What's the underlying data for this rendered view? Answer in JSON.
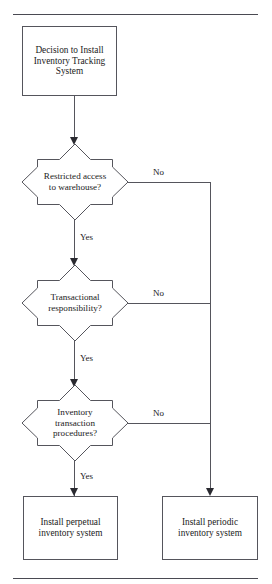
{
  "document": {
    "title": "Inventory Tracking System Decision Flowchart",
    "rules": {
      "top_label": "top-separator-rule",
      "bottom_label": "bottom-separator-rule"
    }
  },
  "flowchart": {
    "type": "decision-flowchart",
    "orientation": "top-to-bottom",
    "line_color": "#55555c",
    "arrow_color": "#2a2a30",
    "background": "#ffffff",
    "start": {
      "id": "start-box",
      "shape": "rectangle",
      "lines": [
        "Decision to Install",
        "Inventory Tracking",
        "System"
      ],
      "text": "Decision to Install Inventory Tracking System"
    },
    "decisions": [
      {
        "id": "decision-restricted-access",
        "shape": "star-8",
        "lines": [
          "Restricted access",
          "to warehouse?"
        ],
        "text": "Restricted access to warehouse?",
        "yes_label": "Yes",
        "no_label": "No"
      },
      {
        "id": "decision-transactional-responsibility",
        "shape": "star-8",
        "lines": [
          "Transactional",
          "responsibility?"
        ],
        "text": "Transactional responsibility?",
        "yes_label": "Yes",
        "no_label": "No"
      },
      {
        "id": "decision-inventory-transaction-procedures",
        "shape": "star-8",
        "lines": [
          "Inventory",
          "transaction",
          "procedures?"
        ],
        "text": "Inventory transaction procedures?",
        "yes_label": "Yes",
        "no_label": "No"
      }
    ],
    "terminals": [
      {
        "id": "terminal-perpetual",
        "shape": "rectangle",
        "lines": [
          "Install perpetual",
          "inventory system"
        ],
        "text": "Install perpetual inventory system"
      },
      {
        "id": "terminal-periodic",
        "shape": "rectangle",
        "lines": [
          "Install periodic",
          "inventory system"
        ],
        "text": "Install periodic inventory system"
      }
    ]
  }
}
